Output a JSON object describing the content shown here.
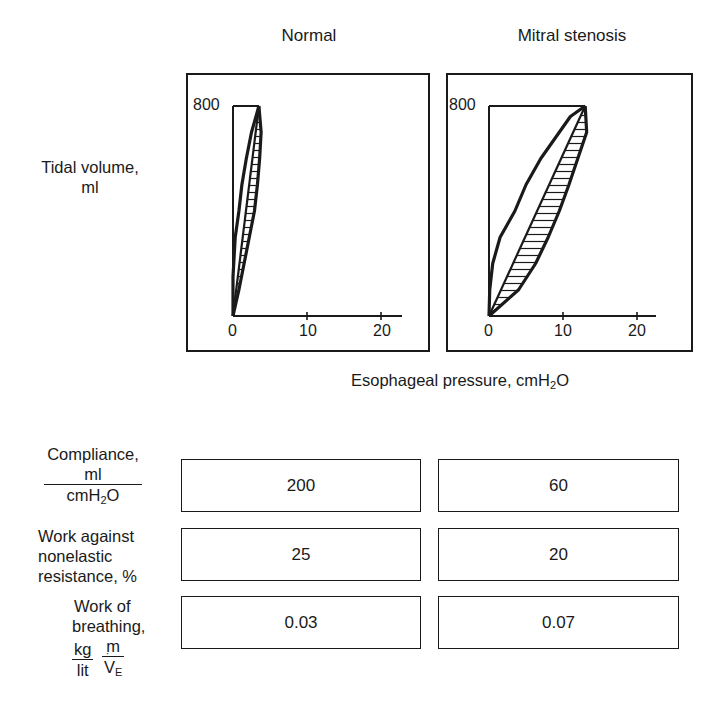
{
  "columns": {
    "normal": "Normal",
    "stenosis": "Mitral stenosis"
  },
  "axes": {
    "y_label_line1": "Tidal volume,",
    "y_label_line2": "ml",
    "x_label_prefix": "Esophageal pressure, cmH",
    "x_label_sub": "2",
    "x_label_suffix": "O",
    "y_tick": "800",
    "x_ticks": [
      "0",
      "10",
      "20"
    ]
  },
  "rows": [
    {
      "label_lines": [
        "Compliance,"
      ],
      "fraction": {
        "num": "ml",
        "den_prefix": "cmH",
        "den_sub": "2",
        "den_suffix": "O"
      },
      "normal": "200",
      "stenosis": "60"
    },
    {
      "label_lines": [
        "Work against",
        "nonelastic",
        "resistance, %"
      ],
      "normal": "25",
      "stenosis": "20"
    },
    {
      "label_lines": [
        "Work of",
        "breathing,"
      ],
      "fraction1": {
        "num": "kg",
        "den": "lit"
      },
      "fraction2": {
        "num": "m",
        "den": "V",
        "den_sub": "E"
      },
      "normal": "0.03",
      "stenosis": "0.07"
    }
  ],
  "chart_data": [
    {
      "type": "line",
      "title": "Normal",
      "xlabel": "Esophageal pressure, cmH2O",
      "ylabel": "Tidal volume, ml",
      "xlim": [
        0,
        22
      ],
      "ylim": [
        0,
        800
      ],
      "x_ticks": [
        0,
        10,
        20
      ],
      "y_ticks": [
        800
      ],
      "end_point": [
        3.5,
        800
      ],
      "inspiration_curve": [
        [
          0,
          0
        ],
        [
          0,
          150
        ],
        [
          0.3,
          300
        ],
        [
          0.8,
          400
        ],
        [
          1.2,
          500
        ],
        [
          1.8,
          600
        ],
        [
          2.5,
          700
        ],
        [
          3.5,
          800
        ]
      ],
      "expiration_curve": [
        [
          3.5,
          800
        ],
        [
          3.8,
          700
        ],
        [
          3.6,
          600
        ],
        [
          3.3,
          500
        ],
        [
          2.9,
          400
        ],
        [
          2.2,
          300
        ],
        [
          1.5,
          200
        ],
        [
          0.8,
          100
        ],
        [
          0,
          0
        ]
      ],
      "compliance_ml_per_cmH2O": 200
    },
    {
      "type": "line",
      "title": "Mitral stenosis",
      "xlabel": "Esophageal pressure, cmH2O",
      "ylabel": "Tidal volume, ml",
      "xlim": [
        0,
        22
      ],
      "ylim": [
        0,
        800
      ],
      "x_ticks": [
        0,
        10,
        20
      ],
      "y_ticks": [
        800
      ],
      "end_point": [
        13,
        800
      ],
      "inspiration_curve": [
        [
          0,
          0
        ],
        [
          0.1,
          100
        ],
        [
          0.5,
          200
        ],
        [
          1.5,
          300
        ],
        [
          3.5,
          400
        ],
        [
          5,
          500
        ],
        [
          7,
          600
        ],
        [
          9.5,
          700
        ],
        [
          11,
          760
        ],
        [
          13,
          800
        ]
      ],
      "expiration_curve": [
        [
          13,
          800
        ],
        [
          13.2,
          700
        ],
        [
          12,
          600
        ],
        [
          10.8,
          500
        ],
        [
          9.5,
          400
        ],
        [
          8,
          300
        ],
        [
          6.3,
          200
        ],
        [
          4,
          100
        ],
        [
          0,
          0
        ]
      ],
      "compliance_ml_per_cmH2O": 60
    }
  ]
}
